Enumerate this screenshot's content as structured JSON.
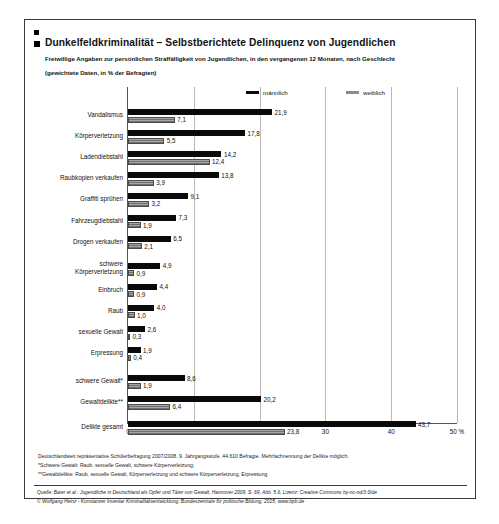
{
  "header": {
    "title": "Dunkelfeldkriminalität – Selbstberichtete Delinquenz von Jugendlichen",
    "subtitle_line1": "Freiwillige Angaben zur persönlichen Straffälligkeit von Jugendlichen, in den vergangenen 12 Monaten, nach Geschlecht",
    "subtitle_line2": "(gewichtete Daten, in % der Befragten)"
  },
  "notes": {
    "line1": "Deutschlandweit repräsentative Schülerbefragung 2007/2008. 9. Jahrgangsstufe. 44.610 Befragte. Mehrfachnennung der Delikte möglich.",
    "line2": "*Schwere Gewalt: Raub, sexuelle Gewalt, schwere Körperverletzung;",
    "line3": "**Gewaltdelikte: Raub, sexuelle Gewalt, Körperverletzung und schwere Körperverletzung, Erpressung"
  },
  "source": {
    "line1": "Quelle: Baier et al.: Jugendliche in Deutschland als Opfer und Täter von Gewalt, Hannover 2009, S. 69, Abb. 5.6, Lizenz: Creative Commons by-nc-nd/3.0/de",
    "line2": "© Wolfgang Heinz - Konstanzer Inventar Kriminalitätsentwicklung; Bundeszentrale für politische Bildung, 2015, www.bpb.de"
  },
  "caption": "",
  "chart_data": {
    "type": "bar",
    "orientation": "horizontal",
    "title": "Dunkelfeldkriminalität – Selbstberichtete Delinquenz von Jugendlichen",
    "xlabel": "50 %",
    "ylabel": "",
    "xlim": [
      0,
      50
    ],
    "xticks": [
      0,
      10,
      20,
      30,
      40,
      50
    ],
    "xtick_labels": [
      "0",
      "10",
      "20",
      "30",
      "40",
      "50 %"
    ],
    "grid": true,
    "legend_position": "top-right",
    "categories": [
      "Vandalismus",
      "Körperverletzung",
      "Ladendiebstahl",
      "Raubkopien verkaufen",
      "Graffiti sprühen",
      "Fahrzeugdiebstahl",
      "Drogen verkaufen",
      "schwere\nKörperverletzung",
      "Einbruch",
      "Raub",
      "sexuelle Gewalt",
      "Erpressung",
      "schwere Gewalt*",
      "Gewaltdelikte**",
      "Delikte gesamt"
    ],
    "series": [
      {
        "name": "männlich",
        "color": "#0a0a0a",
        "values": [
          21.9,
          17.8,
          14.2,
          13.8,
          9.1,
          7.3,
          6.5,
          4.9,
          4.4,
          4.0,
          2.6,
          1.9,
          8.6,
          20.2,
          43.7
        ],
        "labels": [
          "21,9",
          "17,8",
          "14,2",
          "13,8",
          "9,1",
          "7,3",
          "6,5",
          "4,9",
          "4,4",
          "4,0",
          "2,6",
          "1,9",
          "8,6",
          "20,2",
          "43,7"
        ]
      },
      {
        "name": "weiblich",
        "color": "#8c8c8c",
        "values": [
          7.1,
          5.5,
          12.4,
          3.9,
          3.2,
          1.9,
          2.1,
          0.9,
          0.9,
          1.0,
          0.3,
          0.4,
          1.9,
          6.4,
          23.8
        ],
        "labels": [
          "7,1",
          "5,5",
          "12,4",
          "3,9",
          "3,2",
          "1,9",
          "2,1",
          "0,9",
          "0,9",
          "1,0",
          "0,3",
          "0,4",
          "1,9",
          "6,4",
          "23,8"
        ]
      }
    ]
  }
}
